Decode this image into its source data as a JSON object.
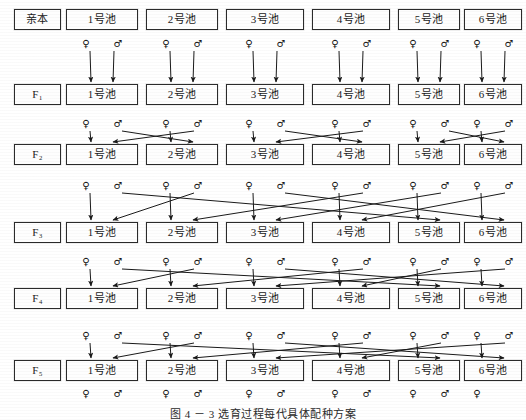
{
  "figure": {
    "caption": "图 4 － 3   选育过程每代具体配种方案",
    "caption_top": 405,
    "width": 526,
    "height": 420
  },
  "layout": {
    "gen_label_box": {
      "x": 14,
      "w": 47,
      "h": 21
    },
    "pond_boxes": [
      {
        "x": 66,
        "w": 72
      },
      {
        "x": 146,
        "w": 72
      },
      {
        "x": 226,
        "w": 78
      },
      {
        "x": 312,
        "w": 78
      },
      {
        "x": 398,
        "w": 62
      },
      {
        "x": 464,
        "w": 58
      }
    ],
    "row_tops": [
      9,
      84,
      144,
      222,
      288,
      360
    ],
    "symbol_rows_y": [
      44,
      124,
      186,
      262,
      336,
      394
    ]
  },
  "glyphs": {
    "female": "♀",
    "male": "♂"
  },
  "generations": [
    {
      "id": "parent",
      "label": "亲本",
      "label_plain": "亲本",
      "ponds": [
        "1号池",
        "2号池",
        "3号池",
        "4号池",
        "5号池",
        "6号池"
      ]
    },
    {
      "id": "f1",
      "label": "F₁",
      "label_plain": "F1",
      "ponds": [
        "1号池",
        "2号池",
        "3号池",
        "4号池",
        "5号池",
        "6号池"
      ]
    },
    {
      "id": "f2",
      "label": "F₂",
      "label_plain": "F2",
      "ponds": [
        "1号池",
        "2号池",
        "3号池",
        "4号池",
        "5号池",
        "6号池"
      ]
    },
    {
      "id": "f3",
      "label": "F₃",
      "label_plain": "F3",
      "ponds": [
        "1号池",
        "2号池",
        "3号池",
        "4号池",
        "5号池",
        "6号池"
      ]
    },
    {
      "id": "f4",
      "label": "F₄",
      "label_plain": "F4",
      "ponds": [
        "1号池",
        "2号池",
        "3号池",
        "4号池",
        "5号池",
        "6号池"
      ]
    },
    {
      "id": "f5",
      "label": "F₅",
      "label_plain": "F5",
      "ponds": [
        "1号池",
        "2号池",
        "3号池",
        "4号池",
        "5号池",
        "6号池"
      ]
    }
  ],
  "mating_rows": [
    {
      "from": "parent",
      "to": "f1",
      "scheme": "within-pond",
      "description": "每池亲本自交：♀与♂来自同一池，后代进入同号池",
      "pairs": [
        {
          "female_from": 1,
          "male_from": 1,
          "to": 1
        },
        {
          "female_from": 2,
          "male_from": 2,
          "to": 2
        },
        {
          "female_from": 3,
          "male_from": 3,
          "to": 3
        },
        {
          "female_from": 4,
          "male_from": 4,
          "to": 4
        },
        {
          "female_from": 5,
          "male_from": 5,
          "to": 5
        },
        {
          "female_from": 6,
          "male_from": 6,
          "to": 6
        }
      ]
    },
    {
      "from": "f1",
      "to": "f2",
      "scheme": "adjacent-swap",
      "description": "相邻两池互换：1♀×2♂ 进 1 池，2♀×1♂ 进 2 池，依此类推",
      "pairs": [
        {
          "female_from": 1,
          "male_from": 2,
          "to": 1
        },
        {
          "female_from": 2,
          "male_from": 1,
          "to": 2
        },
        {
          "female_from": 3,
          "male_from": 4,
          "to": 3
        },
        {
          "female_from": 4,
          "male_from": 3,
          "to": 4
        },
        {
          "female_from": 5,
          "male_from": 6,
          "to": 5
        },
        {
          "female_from": 6,
          "male_from": 5,
          "to": 6
        }
      ]
    },
    {
      "from": "f2",
      "to": "f3",
      "scheme": "rotational-wide",
      "description": "跨池轮配：♀就近、♂远池交叉配种",
      "pairs": [
        {
          "female_from": 1,
          "male_from": 2,
          "to": 1
        },
        {
          "female_from": 2,
          "male_from": 4,
          "to": 2
        },
        {
          "female_from": 3,
          "male_from": 5,
          "to": 3
        },
        {
          "female_from": 4,
          "male_from": 6,
          "to": 4
        },
        {
          "female_from": 5,
          "male_from": 1,
          "to": 5
        },
        {
          "female_from": 6,
          "male_from": 3,
          "to": 6
        }
      ]
    },
    {
      "from": "f3",
      "to": "f4",
      "scheme": "rotational-wide",
      "description": "跨池轮配：♀就近、♂远池交叉配种",
      "pairs": [
        {
          "female_from": 1,
          "male_from": 2,
          "to": 1
        },
        {
          "female_from": 2,
          "male_from": 4,
          "to": 2
        },
        {
          "female_from": 3,
          "male_from": 6,
          "to": 3
        },
        {
          "female_from": 4,
          "male_from": 5,
          "to": 4
        },
        {
          "female_from": 5,
          "male_from": 1,
          "to": 5
        },
        {
          "female_from": 6,
          "male_from": 3,
          "to": 6
        }
      ]
    },
    {
      "from": "f4",
      "to": "f5",
      "scheme": "rotational-wide",
      "description": "跨池轮配：♀就近、♂远池交叉配种",
      "pairs": [
        {
          "female_from": 1,
          "male_from": 2,
          "to": 1
        },
        {
          "female_from": 2,
          "male_from": 4,
          "to": 2
        },
        {
          "female_from": 3,
          "male_from": 6,
          "to": 3
        },
        {
          "female_from": 4,
          "male_from": 5,
          "to": 4
        },
        {
          "female_from": 5,
          "male_from": 1,
          "to": 5
        },
        {
          "female_from": 6,
          "male_from": 3,
          "to": 6
        }
      ]
    }
  ],
  "terminal_symbols": {
    "description": "F₅ 池下方标注的雌雄符号",
    "sequence": [
      "♀",
      "♂",
      "♀",
      "♂",
      "♀",
      "♂",
      "♀",
      "♂",
      "♀",
      "♂",
      "♀"
    ]
  },
  "colors": {
    "ink": "#1a1a1a",
    "box_border": "#2b2b2b",
    "box_fill": "#fefefe",
    "page": "#ffffff"
  }
}
